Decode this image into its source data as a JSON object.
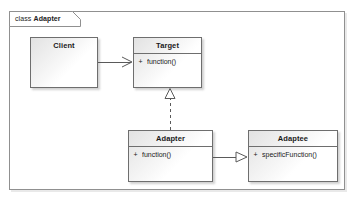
{
  "diagram": {
    "kind_label": "class",
    "name": "Adapter",
    "title": "class Adapter",
    "frame_border_color": "#909090",
    "class_border_color": "#6e6e6e",
    "text_color": "#1a1a1a",
    "background_color": "#ffffff"
  },
  "classes": [
    {
      "id": "client",
      "name": "Client",
      "operations": []
    },
    {
      "id": "target",
      "name": "Target",
      "operations": [
        {
          "visibility": "+",
          "signature": "function()"
        }
      ]
    },
    {
      "id": "adapter",
      "name": "Adapter",
      "operations": [
        {
          "visibility": "+",
          "signature": "function()"
        }
      ]
    },
    {
      "id": "adaptee",
      "name": "Adaptee",
      "operations": [
        {
          "visibility": "+",
          "signature": "specificFunction()"
        }
      ]
    }
  ],
  "relationships": [
    {
      "id": "client-target",
      "from": "Client",
      "to": "Target",
      "type": "association",
      "line": "solid",
      "arrowhead": "open"
    },
    {
      "id": "adapter-target",
      "from": "Adapter",
      "to": "Target",
      "type": "realization",
      "line": "dashed",
      "arrowhead": "hollow-triangle"
    },
    {
      "id": "adapter-adaptee",
      "from": "Adapter",
      "to": "Adaptee",
      "type": "generalization",
      "line": "solid",
      "arrowhead": "hollow-triangle"
    }
  ]
}
